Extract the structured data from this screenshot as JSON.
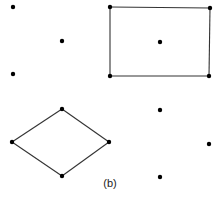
{
  "figure": {
    "caption": "(b)",
    "colors": {
      "ink": "#000000",
      "edge": "#333333",
      "background": "#ffffff"
    },
    "groups": [
      {
        "id": "group-top-left",
        "description": "three isolated points",
        "points": [
          "a1",
          "a2",
          "a3"
        ],
        "edges": []
      },
      {
        "id": "group-rectangle",
        "description": "rectangle with center point",
        "points": [
          "r1",
          "r2",
          "r3",
          "r4",
          "rc"
        ],
        "edges": [
          [
            "r1",
            "r2"
          ],
          [
            "r2",
            "r4"
          ],
          [
            "r4",
            "r3"
          ],
          [
            "r3",
            "r1"
          ]
        ]
      },
      {
        "id": "group-diamond",
        "description": "diamond (rhombus)",
        "points": [
          "d1",
          "d2",
          "d3",
          "d4"
        ],
        "edges": [
          [
            "d1",
            "d3"
          ],
          [
            "d3",
            "d4"
          ],
          [
            "d4",
            "d2"
          ],
          [
            "d2",
            "d1"
          ]
        ]
      },
      {
        "id": "group-bottom-right",
        "description": "three isolated points",
        "points": [
          "b1",
          "b2",
          "b3"
        ],
        "edges": []
      }
    ]
  }
}
